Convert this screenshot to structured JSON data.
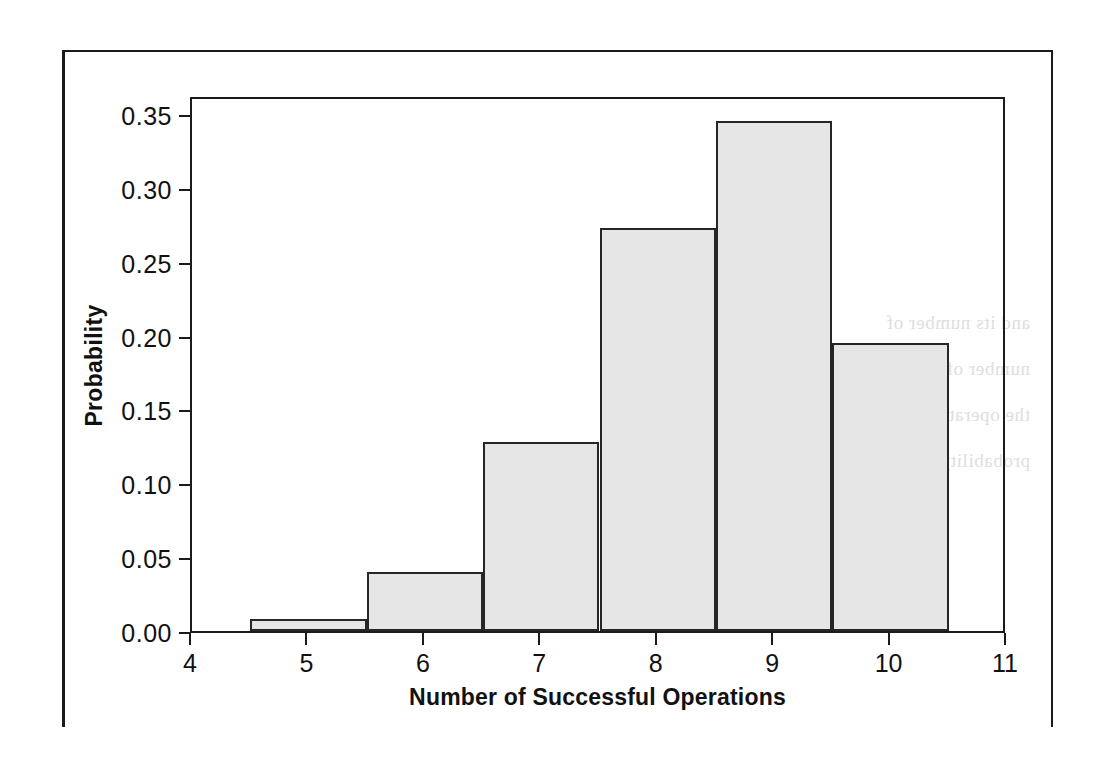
{
  "chart_data": {
    "type": "bar",
    "title": "",
    "xlabel": "Number of Successful Operations",
    "ylabel": "Probability",
    "categories": [
      "4",
      "5",
      "6",
      "7",
      "8",
      "9",
      "10",
      "11"
    ],
    "x": [
      4,
      5,
      6,
      7,
      8,
      9,
      10,
      11
    ],
    "values": [
      0.0,
      0.008,
      0.04,
      0.128,
      0.273,
      0.345,
      0.195,
      0.0
    ],
    "bar_width": 1,
    "xlim": [
      4,
      11
    ],
    "ylim": [
      0.0,
      0.3628
    ],
    "xticks": [
      "4",
      "5",
      "6",
      "7",
      "8",
      "9",
      "10",
      "11"
    ],
    "yticks": [
      "0.00",
      "0.05",
      "0.10",
      "0.15",
      "0.20",
      "0.25",
      "0.30",
      "0.35"
    ],
    "ytick_values": [
      0.0,
      0.05,
      0.1,
      0.15,
      0.2,
      0.25,
      0.3,
      0.35
    ],
    "grid": false,
    "legend": null,
    "bar_fill_color": "#e6e6e6",
    "bar_edge_color": "#262626",
    "axis_color": "#1b1b1b",
    "background_color": "#ffffff"
  },
  "page": {
    "bleed_through_text": "and its number of\nnumber of operations\nthe operation is successful\nprobability distribution"
  }
}
